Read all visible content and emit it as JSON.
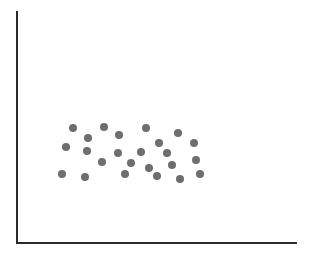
{
  "figure": {
    "width": 322,
    "height": 256,
    "background_color": "#ffffff"
  },
  "chart_data": {
    "type": "scatter",
    "title": "",
    "subtitle": "",
    "xlabel": "",
    "ylabel": "",
    "legend": [],
    "legend_position": "none",
    "grid": false,
    "tick_labels_x": [],
    "tick_labels_y": [],
    "axis_style": {
      "spines": [
        "left",
        "bottom"
      ],
      "color": "#2b2b2b",
      "line_width": 2,
      "ticks": false
    },
    "axes_pixels": {
      "origin_x": 17,
      "origin_y": 243,
      "y_axis_top": 12,
      "x_axis_right": 296
    },
    "marker": {
      "shape": "circle",
      "color": "#6e6e6e",
      "diameter": 8,
      "edge": "none"
    },
    "point_count": 24,
    "xlim": [
      0,
      322
    ],
    "ylim": [
      0,
      256
    ],
    "points": [
      {
        "x": 73,
        "y": 128
      },
      {
        "x": 104,
        "y": 127
      },
      {
        "x": 146,
        "y": 128
      },
      {
        "x": 178,
        "y": 133
      },
      {
        "x": 88,
        "y": 138
      },
      {
        "x": 159,
        "y": 143
      },
      {
        "x": 194,
        "y": 143
      },
      {
        "x": 66,
        "y": 147
      },
      {
        "x": 87,
        "y": 151
      },
      {
        "x": 118,
        "y": 153
      },
      {
        "x": 141,
        "y": 152
      },
      {
        "x": 167,
        "y": 153
      },
      {
        "x": 102,
        "y": 162
      },
      {
        "x": 196,
        "y": 160
      },
      {
        "x": 62,
        "y": 174
      },
      {
        "x": 85,
        "y": 177
      },
      {
        "x": 125,
        "y": 174
      },
      {
        "x": 157,
        "y": 176
      },
      {
        "x": 180,
        "y": 179
      },
      {
        "x": 200,
        "y": 174
      },
      {
        "x": 131,
        "y": 163
      },
      {
        "x": 119,
        "y": 135
      },
      {
        "x": 172,
        "y": 165
      },
      {
        "x": 149,
        "y": 168
      }
    ]
  }
}
